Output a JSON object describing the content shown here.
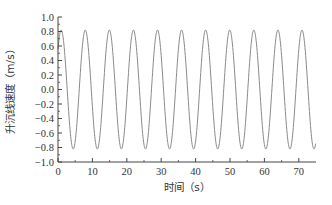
{
  "chart_data": {
    "type": "line",
    "title": "",
    "xlabel": "时间（s）",
    "ylabel": "升沉线速度（m/s）",
    "xlim": [
      0,
      75
    ],
    "ylim": [
      -1.0,
      1.0
    ],
    "grid": false,
    "legend": null,
    "x_ticks": [
      0,
      10,
      20,
      30,
      40,
      50,
      60,
      70
    ],
    "x_tick_labels": [
      "0",
      "10",
      "20",
      "30",
      "40",
      "50",
      "60",
      "70"
    ],
    "y_ticks": [
      1.0,
      0.8,
      0.6,
      0.4,
      0.2,
      0.0,
      -0.2,
      -0.4,
      -0.6,
      -0.8,
      -1.0
    ],
    "y_tick_labels": [
      "1.0",
      "0.8",
      "0.6",
      "0.4",
      "0.2",
      "0.0",
      "-0.2",
      "-0.4",
      "-0.6",
      "-0.8",
      "-1.0"
    ],
    "series": [
      {
        "name": "heave velocity",
        "color": "#8a8a8a",
        "description": "Sinusoid, amplitude ≈0.82 m/s, period ≈7 s, starting ≈0.55 at t=0",
        "x": [
          0,
          1.7,
          5.2,
          8.7,
          12.2,
          15.7,
          19.2,
          22.7,
          26.2,
          29.7,
          33.2,
          36.7,
          40.2,
          43.7,
          47.2,
          50.7,
          54.2,
          57.7,
          61.2,
          64.7,
          68.2,
          71.7,
          75
        ],
        "values": [
          0.55,
          0.8,
          -0.82,
          0.82,
          -0.8,
          0.82,
          -0.82,
          0.8,
          -0.82,
          0.82,
          -0.82,
          0.82,
          -0.82,
          0.8,
          -0.82,
          0.82,
          -0.82,
          0.82,
          -0.82,
          0.82,
          -0.82,
          0.82,
          -0.75
        ]
      }
    ],
    "model": {
      "amplitude": 0.82,
      "period": 7.0,
      "phase": 0.74
    }
  }
}
